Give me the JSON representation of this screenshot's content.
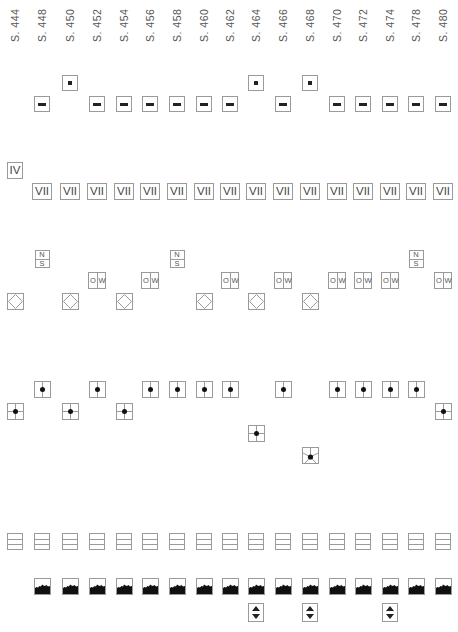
{
  "columns": [
    {
      "label": "S. 444",
      "x": 15
    },
    {
      "label": "S. 448",
      "x": 42
    },
    {
      "label": "S. 450",
      "x": 70
    },
    {
      "label": "S. 452",
      "x": 97
    },
    {
      "label": "S. 454",
      "x": 124
    },
    {
      "label": "S. 456",
      "x": 150
    },
    {
      "label": "S. 458",
      "x": 177
    },
    {
      "label": "S. 460",
      "x": 204
    },
    {
      "label": "S. 462",
      "x": 230
    },
    {
      "label": "S. 464",
      "x": 256
    },
    {
      "label": "S. 466",
      "x": 283
    },
    {
      "label": "S. 468",
      "x": 310
    },
    {
      "label": "S. 470",
      "x": 337
    },
    {
      "label": "S. 472",
      "x": 363
    },
    {
      "label": "S. 474",
      "x": 390
    },
    {
      "label": "S. 478",
      "x": 416
    },
    {
      "label": "S. 480",
      "x": 443
    }
  ],
  "rows": {
    "small_square": {
      "icon": "small-square-icon",
      "y": 75,
      "columns": [
        2,
        9,
        11
      ]
    },
    "dash": {
      "icon": "dash-icon",
      "y": 96,
      "columns": [
        1,
        3,
        4,
        5,
        6,
        7,
        8,
        10,
        12,
        13,
        14,
        15,
        16
      ]
    },
    "roman_iv": {
      "text": "IV",
      "y": 162,
      "columns": [
        0
      ]
    },
    "roman_vii": {
      "text": "VII",
      "y": 183,
      "columns": [
        1,
        2,
        3,
        4,
        5,
        6,
        7,
        8,
        9,
        10,
        11,
        12,
        13,
        14,
        15,
        16
      ]
    },
    "north_south": {
      "top": "N",
      "bottom": "S",
      "y": 250,
      "columns": [
        1,
        6,
        15
      ]
    },
    "east_west": {
      "left": "O",
      "right": "W",
      "y": 272,
      "columns": [
        3,
        5,
        8,
        10,
        12,
        13,
        14,
        16
      ]
    },
    "diamond": {
      "icon": "diamond-in-square-icon",
      "y": 293,
      "columns": [
        0,
        2,
        4,
        7,
        9,
        11
      ]
    },
    "dot_upper": {
      "icon": "dot-vertical-line-icon",
      "y": 381,
      "columns": [
        1,
        3,
        5,
        6,
        7,
        8,
        10,
        12,
        13,
        14,
        15
      ]
    },
    "dot_cross_mid": {
      "icon": "dot-crosshair-icon",
      "y": 403,
      "columns": [
        0,
        2,
        4,
        16
      ]
    },
    "dot_cross_low": {
      "icon": "dot-crosshair-icon",
      "y": 425,
      "columns": [
        9
      ]
    },
    "dot_star": {
      "icon": "dot-star-icon",
      "y": 447,
      "columns": [
        11
      ]
    },
    "three_lines": {
      "icon": "three-lines-icon",
      "y": 533,
      "columns": [
        0,
        1,
        2,
        3,
        4,
        5,
        6,
        7,
        8,
        9,
        10,
        11,
        12,
        13,
        14,
        15,
        16
      ]
    },
    "landscape": {
      "icon": "landscape-silhouette-icon",
      "y": 578,
      "columns": [
        1,
        2,
        3,
        4,
        5,
        6,
        7,
        8,
        9,
        10,
        11,
        12,
        13,
        14,
        15,
        16
      ]
    },
    "up_down": {
      "icon": "up-down-arrows-icon",
      "y": 603,
      "columns": [
        9,
        11,
        14
      ]
    }
  },
  "colors": {
    "border": "#9a9a9a",
    "glyph": "#222222",
    "label": "#555555",
    "background": "#ffffff"
  }
}
